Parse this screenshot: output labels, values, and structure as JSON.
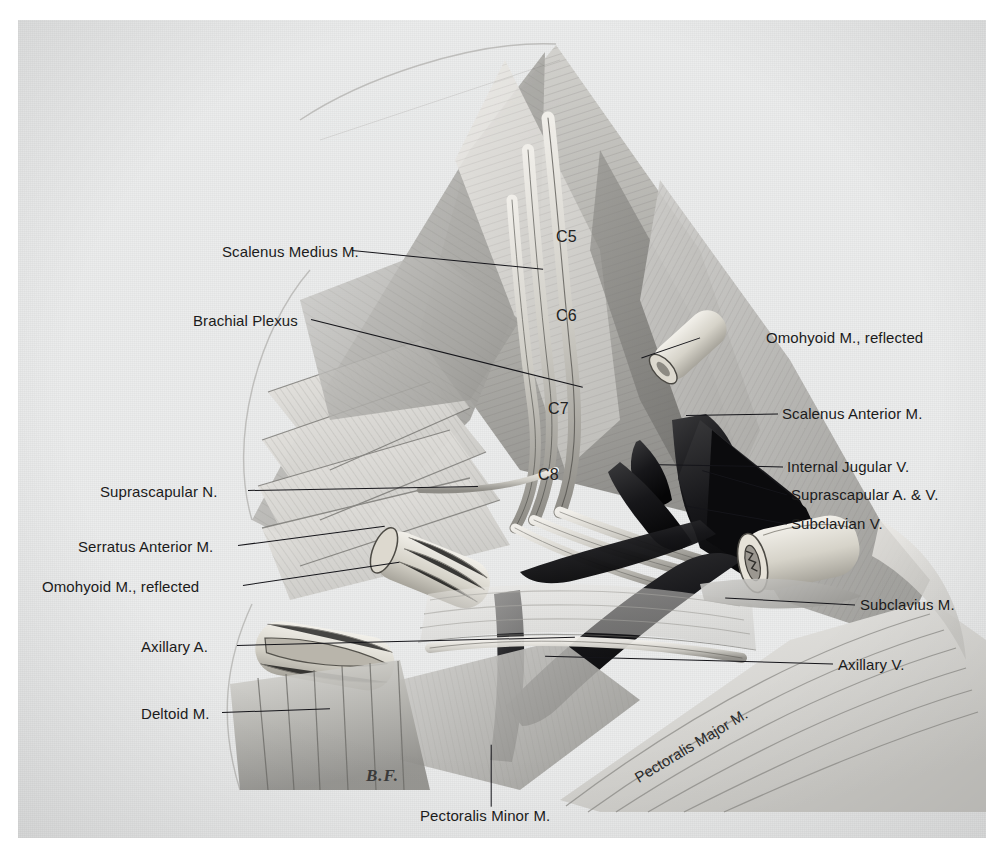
{
  "plate": {
    "title": "Brachial Plexus and Axilla Dissection",
    "signature": "B.F.",
    "page_bg": "#eceded",
    "ink": "#1b1b1b"
  },
  "nerve_roots": [
    {
      "label": "C5",
      "x": 556,
      "y": 228
    },
    {
      "label": "C6",
      "x": 556,
      "y": 307
    },
    {
      "label": "C7",
      "x": 548,
      "y": 400
    },
    {
      "label": "C8",
      "x": 538,
      "y": 466
    }
  ],
  "labels_left": [
    {
      "text": "Scalenus Medius M.",
      "x": 222,
      "y": 244,
      "lx": 352,
      "ly": 250,
      "len": 192,
      "ang": 5.6
    },
    {
      "text": "Brachial Plexus",
      "x": 193,
      "y": 313,
      "lx": 311,
      "ly": 319,
      "len": 280,
      "ang": 14.0
    },
    {
      "text": "Suprascapular N.",
      "x": 100,
      "y": 484,
      "lx": 248,
      "ly": 490,
      "len": 230,
      "ang": -1.0
    },
    {
      "text": "Serratus Anterior M.",
      "x": 78,
      "y": 539,
      "lx": 238,
      "ly": 545,
      "len": 148,
      "ang": -7.5
    },
    {
      "text": "Omohyoid M., reflected",
      "x": 42,
      "y": 579,
      "lx": 243,
      "ly": 585,
      "len": 158,
      "ang": -8.5
    },
    {
      "text": "Axillary A.",
      "x": 141,
      "y": 639,
      "lx": 237,
      "ly": 645,
      "len": 338,
      "ang": -1.4
    },
    {
      "text": "Deltoid M.",
      "x": 141,
      "y": 706,
      "lx": 222,
      "ly": 712,
      "len": 108,
      "ang": -2.0
    }
  ],
  "labels_right": [
    {
      "text": "Omohyoid M., reflected",
      "x": 766,
      "y": 330,
      "lx": 700,
      "ly": 337,
      "len": 62,
      "ang": 161.0
    },
    {
      "text": "Scalenus Anterior M.",
      "x": 782,
      "y": 406,
      "lx": 778,
      "ly": 413,
      "len": 92,
      "ang": 179.0
    },
    {
      "text": "Internal Jugular V.",
      "x": 787,
      "y": 459,
      "lx": 783,
      "ly": 466,
      "len": 124,
      "ang": 181.0
    },
    {
      "text": "Suprascapular A. & V.",
      "x": 791,
      "y": 487,
      "lx": 787,
      "ly": 494,
      "len": 88,
      "ang": 196.0
    },
    {
      "text": "Subclavian V.",
      "x": 791,
      "y": 516,
      "lx": 787,
      "ly": 523,
      "len": 104,
      "ang": 190.0
    },
    {
      "text": "Subclavius M.",
      "x": 860,
      "y": 597,
      "lx": 855,
      "ly": 604,
      "len": 130,
      "ang": 183.0
    },
    {
      "text": "Axillary V.",
      "x": 838,
      "y": 657,
      "lx": 833,
      "ly": 663,
      "len": 288,
      "ang": 181.5
    }
  ],
  "labels_bottom": [
    {
      "text": "Pectoralis Minor M.",
      "x": 420,
      "y": 808,
      "lx": 491,
      "ly": 744,
      "len": 62,
      "ang": 90.0
    }
  ],
  "labels_rotated": [
    {
      "text": "Pectoralis Major M.",
      "x": 636,
      "y": 770,
      "angle": -31
    }
  ]
}
